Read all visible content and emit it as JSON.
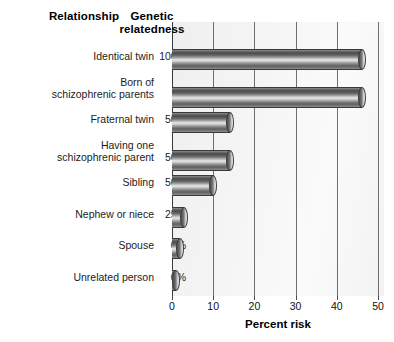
{
  "headers": {
    "relationship": "Relationship",
    "relatedness_line1": "Genetic",
    "relatedness_line2": "relatedness"
  },
  "chart_data": {
    "type": "bar",
    "orientation": "horizontal",
    "title": "",
    "xlabel": "Percent risk",
    "ylabel": "Relationship",
    "xlim": [
      0,
      50
    ],
    "xticks": [
      "0",
      "10",
      "20",
      "30",
      "40",
      "50"
    ],
    "grid": true,
    "legend": "none",
    "categories": [
      "Identical twin",
      "Born of schizophrenic parents",
      "Fraternal twin",
      "Having one schizophrenic parent",
      "Sibling",
      "Nephew or niece",
      "Spouse",
      "Unrelated person"
    ],
    "values": [
      46,
      46,
      14,
      14,
      10,
      3,
      2,
      1
    ],
    "genetic_relatedness": [
      "100%",
      "--",
      "50%",
      "50%",
      "50%",
      "25%",
      "0%",
      "0%"
    ]
  },
  "rows": [
    {
      "label_line1": "Identical twin",
      "label_line2": "",
      "pct": "100%",
      "value": 46
    },
    {
      "label_line1": "Born of",
      "label_line2": "schizophrenic parents",
      "pct": "--",
      "value": 46
    },
    {
      "label_line1": "Fraternal twin",
      "label_line2": "",
      "pct": "50%",
      "value": 14
    },
    {
      "label_line1": "Having one",
      "label_line2": "schizophrenic parent",
      "pct": "50%",
      "value": 14
    },
    {
      "label_line1": "Sibling",
      "label_line2": "",
      "pct": "50%",
      "value": 10
    },
    {
      "label_line1": "Nephew or niece",
      "label_line2": "",
      "pct": "25%",
      "value": 3
    },
    {
      "label_line1": "Spouse",
      "label_line2": "",
      "pct": "0%",
      "value": 2
    },
    {
      "label_line1": "Unrelated person",
      "label_line2": "",
      "pct": "0%",
      "value": 1
    }
  ],
  "axis": {
    "title": "Percent risk",
    "ticks": [
      {
        "label": "0",
        "value": 0
      },
      {
        "label": "10",
        "value": 10
      },
      {
        "label": "20",
        "value": 20
      },
      {
        "label": "30",
        "value": 30
      },
      {
        "label": "40",
        "value": 40
      },
      {
        "label": "50",
        "value": 50
      }
    ]
  },
  "colors": {
    "bar_dark": "#4a4a4a",
    "bar_light": "#e8e8e8",
    "panel": "#f2f2f2",
    "gridline": "#6f6f6f",
    "text": "#111111"
  }
}
